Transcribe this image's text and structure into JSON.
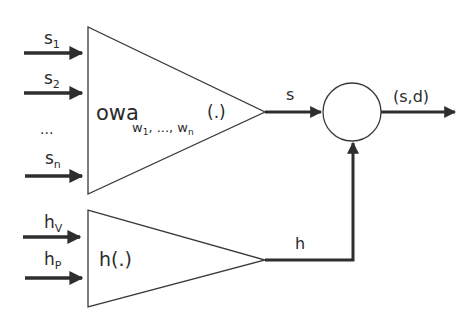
{
  "diagram": {
    "inputs_top": [
      {
        "base": "s",
        "sub": "1"
      },
      {
        "base": "s",
        "sub": "2"
      },
      {
        "ellipsis": "..."
      },
      {
        "base": "s",
        "sub": "n"
      }
    ],
    "owa_block": {
      "main": "owa",
      "subscript_w1": "w",
      "subscript_w1_idx": "1",
      "subscript_sep": ", ..., ",
      "subscript_wn": "w",
      "subscript_wn_idx": "n",
      "arg": "(.)"
    },
    "owa_output": "s",
    "inputs_bottom": [
      {
        "base": "h",
        "sub": "V"
      },
      {
        "base": "h",
        "sub": "P"
      }
    ],
    "h_block": {
      "label": "h(.)"
    },
    "h_output": "h",
    "combiner_output": "(s,d)",
    "colors": {
      "stroke": "#3a3a3a",
      "arrow": "#2e2e2e",
      "background": "#ffffff"
    }
  }
}
